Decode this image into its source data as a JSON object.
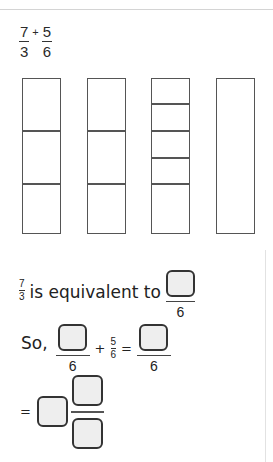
{
  "problem": {
    "term1": {
      "numerator": "7",
      "denominator": "3"
    },
    "operator": "+",
    "term2": {
      "numerator": "5",
      "denominator": "6"
    }
  },
  "bar_models": [
    {
      "parts": 3,
      "label": "thirds"
    },
    {
      "parts": 3,
      "label": "thirds"
    },
    {
      "parts": 6,
      "label": "sixths"
    },
    {
      "parts": 1,
      "label": "whole"
    }
  ],
  "step1": {
    "fraction": {
      "numerator": "7",
      "denominator": "3"
    },
    "text": "is equivalent to",
    "answer_denominator": "6",
    "answer_numerator_value": ""
  },
  "step2": {
    "prefix": "So,",
    "answer_denominator": "6",
    "operator": "+",
    "term2": {
      "numerator": "5",
      "denominator": "6"
    },
    "equals": "=",
    "result_denominator": "6",
    "answer_numerator_value": "",
    "result_numerator_value": ""
  },
  "step3": {
    "equals": "=",
    "whole_value": "",
    "numerator_value": "",
    "denominator_value": ""
  },
  "colors": {
    "answer_box_fill": "#eeeeee",
    "answer_box_border": "#333333",
    "bar_outline": "#555555"
  }
}
